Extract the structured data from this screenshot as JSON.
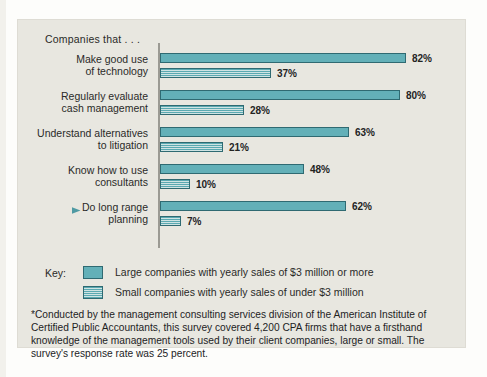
{
  "chart_data": {
    "type": "bar",
    "orientation": "horizontal",
    "title": "Companies that . . .",
    "xlabel": "",
    "ylabel": "",
    "xlim": [
      0,
      100
    ],
    "grid": false,
    "legend_position": "below-plot",
    "categories": [
      "Make good use of technology",
      "Regularly evaluate cash management",
      "Understand alternatives to litigation",
      "Know how to use consultants",
      "Do long range planning"
    ],
    "series": [
      {
        "name": "Large companies with yearly sales of $3 million or more",
        "values": [
          82,
          80,
          63,
          48,
          62
        ],
        "color": "#63b0b8",
        "pattern": "solid"
      },
      {
        "name": "Small companies with yearly sales of under $3 million",
        "values": [
          37,
          28,
          21,
          10,
          7
        ],
        "color": "#5aa9b1",
        "pattern": "horizontal-stripes"
      }
    ],
    "value_labels": [
      [
        "82%",
        "37%"
      ],
      [
        "80%",
        "28%"
      ],
      [
        "63%",
        "21%"
      ],
      [
        "48%",
        "10%"
      ],
      [
        "62%",
        "7%"
      ]
    ],
    "annotations": [
      {
        "target": "Do long range planning",
        "marker": "arrow-right",
        "color": "#4f9aa3"
      }
    ]
  },
  "chart": {
    "header": "Companies that . . .",
    "rows": [
      {
        "label_line1": "Make good use",
        "label_line2": "of technology",
        "large_value": 82,
        "large_label": "82%",
        "small_value": 37,
        "small_label": "37%",
        "arrow": false
      },
      {
        "label_line1": "Regularly evaluate",
        "label_line2": "cash management",
        "large_value": 80,
        "large_label": "80%",
        "small_value": 28,
        "small_label": "28%",
        "arrow": false
      },
      {
        "label_line1": "Understand alternatives",
        "label_line2": "to litigation",
        "large_value": 63,
        "large_label": "63%",
        "small_value": 21,
        "small_label": "21%",
        "arrow": false
      },
      {
        "label_line1": "Know how to use",
        "label_line2": "consultants",
        "large_value": 48,
        "large_label": "48%",
        "small_value": 10,
        "small_label": "10%",
        "arrow": false
      },
      {
        "label_line1": "Do long range",
        "label_line2": "planning",
        "large_value": 62,
        "large_label": "62%",
        "small_value": 7,
        "small_label": "7%",
        "arrow": true
      }
    ]
  },
  "key": {
    "title": "Key:",
    "items": [
      {
        "swatch": "solid",
        "text": "Large companies with yearly sales of $3 million or more"
      },
      {
        "swatch": "striped",
        "text": "Small companies with yearly sales of under $3 million"
      }
    ]
  },
  "footnote": {
    "text": "*Conducted by the management consulting services division of the American Institute of Certified Public Accountants, this survey covered 4,200 CPA firms that have a firsthand knowledge of the management tools used by their client companies, large or small. The survey's response rate was 25 percent."
  },
  "colors": {
    "large_bar": "#63b0b8",
    "small_bar_stripe": "#5aa9b1",
    "small_bar_ground": "#cfe3e3",
    "bar_outline": "#2f6a72",
    "panel_background": "#e8e7e0",
    "axis": "#9b9a93",
    "arrow": "#4f9aa3",
    "text": "#23231f"
  },
  "scale": {
    "px_per_percent": 3.0,
    "max_percent": 100
  }
}
